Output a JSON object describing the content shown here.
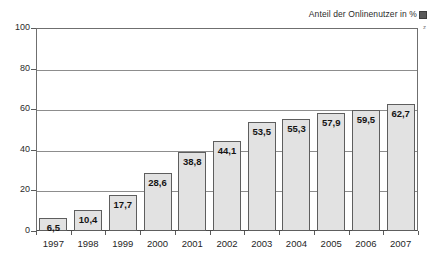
{
  "chart_data": {
    "type": "bar",
    "title": "Anteil der Onlinenutzer in %",
    "xlabel": "",
    "ylabel": "",
    "ylim": [
      0,
      100
    ],
    "ytick_values": [
      0,
      20,
      40,
      60,
      80,
      100
    ],
    "ytick_labels": [
      "0",
      "20",
      "40",
      "60",
      "80",
      "100"
    ],
    "grid": true,
    "gridlines_at": [
      20,
      40,
      60,
      80
    ],
    "legend": "none",
    "decimal_separator": ",",
    "categories": [
      "1997",
      "1998",
      "1999",
      "2000",
      "2001",
      "2002",
      "2003",
      "2004",
      "2005",
      "2006",
      "2007"
    ],
    "values": [
      6.5,
      10.4,
      17.7,
      28.6,
      38.8,
      44.1,
      53.5,
      55.3,
      57.9,
      59.5,
      62.7
    ],
    "value_labels": [
      "6,5",
      "10,4",
      "17,7",
      "28,6",
      "38,8",
      "44,1",
      "53,5",
      "55,3",
      "57,9",
      "59,5",
      "62,7"
    ],
    "bar_fill_color": "#e2e2e2",
    "bar_border_color": "#5e5e5e",
    "grid_color": "#8d8d8d",
    "axis_color": "#4a4a4a"
  },
  "edge": {
    "glyph": "z"
  }
}
